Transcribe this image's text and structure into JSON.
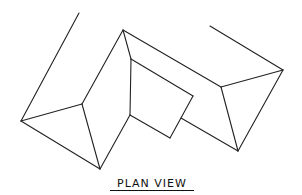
{
  "caption": "PLAN VIEW",
  "stroke_color": "#222222",
  "background_color": "#ffffff",
  "diagram": {
    "type": "roof-plan-line-drawing",
    "vertices": {
      "left_far_top": [
        79,
        13
      ],
      "left_eave": [
        21,
        121
      ],
      "left_hip": [
        82,
        104
      ],
      "left_bottom": [
        100,
        169
      ],
      "top_apex": [
        123,
        30
      ],
      "inner_ridge": [
        131,
        59
      ],
      "box_left": [
        130,
        115
      ],
      "box_right": [
        193,
        96
      ],
      "box_bottom": [
        170,
        138
      ],
      "right_far_top": [
        210,
        26
      ],
      "right_ridge": [
        221,
        87
      ],
      "right_eave": [
        283,
        70
      ],
      "right_bottom": [
        238,
        151
      ]
    }
  }
}
